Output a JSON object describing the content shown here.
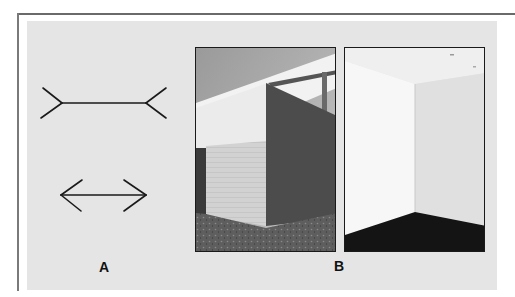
{
  "figure": {
    "panel_a": {
      "label": "A",
      "description": "Müller-Lyer illusion line drawings",
      "figures": [
        {
          "name": "fins-outward",
          "line": [
            62,
            103,
            146,
            103
          ]
        },
        {
          "name": "arrowheads",
          "line": [
            61,
            195,
            146,
            195
          ]
        }
      ]
    },
    "panel_b": {
      "label": "B",
      "photos": [
        {
          "name": "building-exterior-corner",
          "caption": ""
        },
        {
          "name": "room-interior-corner",
          "caption": ""
        }
      ]
    }
  },
  "colors": {
    "panel_bg": "#e5e5e5",
    "line": "#1a1a1a",
    "frame": "#6a6a6a"
  }
}
